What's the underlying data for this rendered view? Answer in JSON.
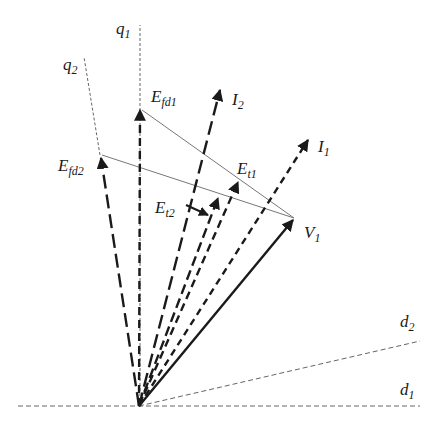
{
  "diagram": {
    "type": "phasor-diagram",
    "colors": {
      "ink": "#1a1a1a",
      "axis": "#555555",
      "thin": "#777777"
    },
    "axes": {
      "q1": {
        "main": "q",
        "sub": "1"
      },
      "q2": {
        "main": "q",
        "sub": "2"
      },
      "d1": {
        "main": "d",
        "sub": "1"
      },
      "d2": {
        "main": "d",
        "sub": "2"
      }
    },
    "phasors": {
      "Efd1": {
        "main": "E",
        "sub": "fd1"
      },
      "Efd2": {
        "main": "E",
        "sub": "fd2"
      },
      "I1": {
        "main": "I",
        "sub": "1"
      },
      "I2": {
        "main": "I",
        "sub": "2"
      },
      "Et1": {
        "main": "E",
        "sub": "t1"
      },
      "Et2": {
        "main": "E",
        "sub": "t2"
      },
      "V1": {
        "main": "V",
        "sub": "1"
      }
    }
  }
}
